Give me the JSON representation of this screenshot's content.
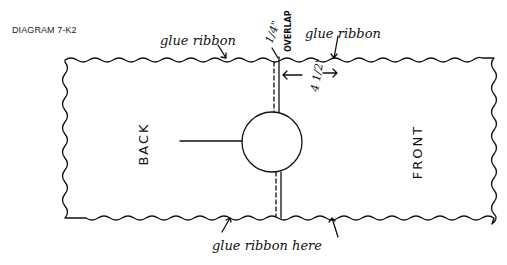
{
  "diagram": {
    "title": "DIAGRAM 7-K2",
    "panels": {
      "left_label": "BACK",
      "right_label": "FRONT"
    },
    "annotations": {
      "top_left": "glue ribbon",
      "top_right": "glue ribbon",
      "bottom": "glue ribbon here",
      "overlap_measure": "1/4\"",
      "overlap_label": "OVERLAP",
      "width_measure": "4 1/2\""
    },
    "colors": {
      "ink": "#111111",
      "background": "#ffffff"
    }
  }
}
